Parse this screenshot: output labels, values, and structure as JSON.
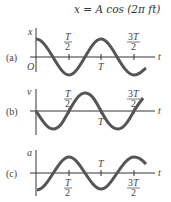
{
  "equation": "x = A cos (2π ft)",
  "panels": [
    {
      "id": "a",
      "label": "(a)",
      "ylabel": "x",
      "origin": "O",
      "xlabel": "t",
      "ticks": [
        "T/2",
        "T",
        "3T/2"
      ],
      "curve": "cosine"
    },
    {
      "id": "b",
      "label": "(b)",
      "ylabel": "v",
      "xlabel": "t",
      "ticks": [
        "T/2",
        "T",
        "3T/2"
      ],
      "curve": "negative sine"
    },
    {
      "id": "c",
      "label": "(c)",
      "ylabel": "a",
      "xlabel": "t",
      "ticks": [
        "T/2",
        "T",
        "3T/2"
      ],
      "curve": "negative cosine"
    }
  ],
  "colors": {
    "curve": "#555555",
    "axis": "#333333"
  }
}
